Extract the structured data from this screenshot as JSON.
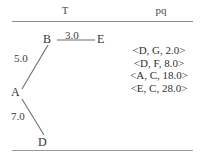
{
  "figure": {
    "headers": {
      "tree_label": "T",
      "pq_label": "pq"
    },
    "graph": {
      "vertices": [
        {
          "id": "A",
          "label": "A",
          "x": 16,
          "y": 92
        },
        {
          "id": "B",
          "label": "B",
          "x": 48,
          "y": 40
        },
        {
          "id": "D",
          "label": "D",
          "x": 43,
          "y": 142
        },
        {
          "id": "E",
          "label": "E",
          "x": 101,
          "y": 40
        }
      ],
      "edges": [
        {
          "from": "A",
          "to": "B",
          "weight": "5.0"
        },
        {
          "from": "B",
          "to": "E",
          "weight": "3.0"
        },
        {
          "from": "A",
          "to": "D",
          "weight": "7.0"
        }
      ]
    },
    "priority_queue": {
      "entries": [
        "<D, G, 2.0>",
        "<D, F, 8.0>",
        "<A, C, 18.0>",
        "<E, C, 28.0>"
      ]
    },
    "colors": {
      "background": "#ffffff",
      "ink": "#303030",
      "rule": "#8d8d8d",
      "edge": "#6e6e6e"
    }
  }
}
